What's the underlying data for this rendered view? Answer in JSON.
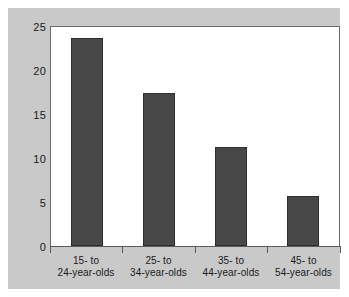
{
  "chart_data": {
    "type": "bar",
    "title": "",
    "subtitle": "",
    "xlabel": "",
    "ylabel": "",
    "categories": [
      "15- to 24-year-olds",
      "25- to 34-year-olds",
      "35- to 44-year-olds",
      "45- to 54-year-olds"
    ],
    "category_lines": [
      [
        "15- to",
        "24-year-olds"
      ],
      [
        "25- to",
        "34-year-olds"
      ],
      [
        "35- to",
        "44-year-olds"
      ],
      [
        "45- to",
        "54-year-olds"
      ]
    ],
    "values": [
      23.8,
      17.5,
      11.3,
      5.7
    ],
    "ylim": [
      0,
      25
    ],
    "yticks": [
      0,
      5,
      10,
      15,
      20,
      25
    ],
    "ytick_labels": [
      "0",
      "5",
      "10",
      "15",
      "20",
      "25"
    ],
    "grid": false,
    "legend": null,
    "bar_color": "#474747",
    "bar_edge_color": "#2e2e2e",
    "plot_background": "#ffffff",
    "panel_background": "#c9c9c9",
    "axis_color": "#5a5a5a",
    "text_color": "#1a1a1a"
  }
}
